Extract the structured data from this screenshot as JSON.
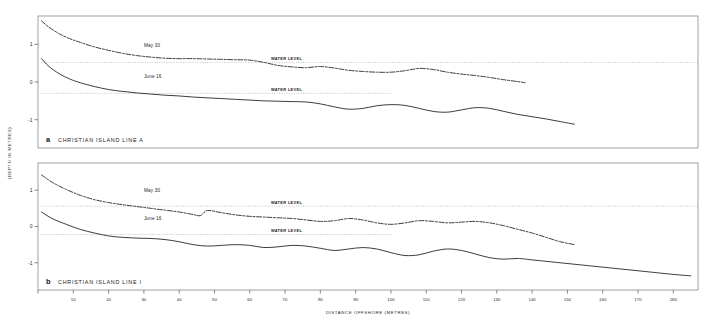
{
  "figure": {
    "xlabel": "DISTANCE OFFSHORE (METRES)",
    "ylabel": "(DEPTH IN METRES)"
  },
  "chart_data": {
    "type": "line",
    "title": "",
    "xlabel": "DISTANCE OFFSHORE (METRES)",
    "ylabel": "(DEPTH IN METRES)",
    "xlim": [
      0,
      187
    ],
    "ylim": [
      -1.75,
      1.75
    ],
    "xticks": [
      0,
      10,
      20,
      30,
      40,
      50,
      60,
      70,
      80,
      90,
      100,
      110,
      120,
      130,
      140,
      150,
      160,
      170,
      180
    ],
    "yticks": [
      1,
      0,
      -1
    ],
    "ytick_labels": [
      "1",
      "0",
      "-1"
    ],
    "grid": false,
    "legend": "inline-annotations",
    "panels": [
      {
        "tag": "a",
        "caption": "CHRISTIAN ISLAND   LINE A",
        "series": [
          {
            "name": "May 30",
            "style": "dashed",
            "label": "May 30",
            "label_x": 30,
            "label_y": 0.92,
            "x": [
              1,
              3,
              6,
              9,
              12,
              16,
              20,
              24,
              28,
              32,
              36,
              40,
              44,
              48,
              52,
              56,
              60,
              64,
              68,
              72,
              76,
              80,
              84,
              88,
              92,
              96,
              100,
              104,
              108,
              112,
              116,
              120,
              124,
              128,
              132,
              136,
              138
            ],
            "y": [
              1.62,
              1.46,
              1.28,
              1.15,
              1.05,
              0.93,
              0.84,
              0.76,
              0.7,
              0.66,
              0.63,
              0.62,
              0.62,
              0.61,
              0.6,
              0.59,
              0.58,
              0.52,
              0.44,
              0.4,
              0.38,
              0.41,
              0.37,
              0.31,
              0.28,
              0.26,
              0.26,
              0.3,
              0.36,
              0.33,
              0.26,
              0.21,
              0.17,
              0.12,
              0.06,
              0.01,
              -0.02
            ]
          },
          {
            "name": "June 16",
            "style": "solid",
            "label": "June 16",
            "label_x": 30,
            "label_y": 0.1,
            "x": [
              1,
              3,
              6,
              9,
              12,
              16,
              20,
              24,
              28,
              32,
              36,
              40,
              44,
              48,
              52,
              56,
              60,
              64,
              68,
              72,
              76,
              80,
              84,
              88,
              92,
              96,
              100,
              104,
              108,
              112,
              116,
              120,
              124,
              128,
              132,
              136,
              140,
              144,
              148,
              152
            ],
            "y": [
              0.62,
              0.42,
              0.22,
              0.08,
              -0.02,
              -0.12,
              -0.2,
              -0.25,
              -0.29,
              -0.32,
              -0.35,
              -0.37,
              -0.4,
              -0.42,
              -0.44,
              -0.46,
              -0.48,
              -0.5,
              -0.51,
              -0.52,
              -0.53,
              -0.58,
              -0.66,
              -0.72,
              -0.7,
              -0.63,
              -0.6,
              -0.62,
              -0.7,
              -0.78,
              -0.8,
              -0.74,
              -0.68,
              -0.7,
              -0.78,
              -0.86,
              -0.92,
              -0.98,
              -1.05,
              -1.12
            ]
          }
        ],
        "water_levels": [
          {
            "label": "WATER LEVEL",
            "y": 0.52,
            "x_start": 1,
            "x_end": 187,
            "label_x": 66
          },
          {
            "label": "WATER LEVEL",
            "y": -0.3,
            "x_start": 1,
            "x_end": 100,
            "label_x": 66
          }
        ]
      },
      {
        "tag": "b",
        "caption": "CHRISTIAN ISLAND    LINE I",
        "series": [
          {
            "name": "May 30",
            "style": "dashed",
            "label": "May 30",
            "label_x": 30,
            "label_y": 0.95,
            "x": [
              1,
              4,
              8,
              12,
              16,
              20,
              24,
              28,
              32,
              36,
              40,
              44,
              46,
              48,
              52,
              56,
              60,
              64,
              68,
              72,
              76,
              80,
              84,
              88,
              92,
              96,
              100,
              104,
              108,
              112,
              116,
              120,
              124,
              128,
              132,
              136,
              140,
              144,
              148,
              152
            ],
            "y": [
              1.42,
              1.22,
              1.02,
              0.86,
              0.74,
              0.66,
              0.6,
              0.55,
              0.5,
              0.45,
              0.4,
              0.33,
              0.3,
              0.44,
              0.38,
              0.32,
              0.28,
              0.26,
              0.24,
              0.22,
              0.18,
              0.14,
              0.16,
              0.22,
              0.18,
              0.1,
              0.06,
              0.1,
              0.16,
              0.14,
              0.1,
              0.12,
              0.14,
              0.1,
              0.02,
              -0.08,
              -0.18,
              -0.3,
              -0.42,
              -0.5
            ]
          },
          {
            "name": "June 16",
            "style": "solid",
            "label": "June 16",
            "label_x": 30,
            "label_y": 0.18,
            "x": [
              1,
              4,
              8,
              12,
              16,
              20,
              24,
              28,
              32,
              36,
              40,
              44,
              48,
              52,
              56,
              60,
              64,
              68,
              72,
              76,
              80,
              84,
              88,
              92,
              96,
              100,
              104,
              108,
              112,
              116,
              120,
              124,
              128,
              132,
              136,
              140,
              148,
              156,
              164,
              172,
              180,
              185
            ],
            "y": [
              0.4,
              0.22,
              0.06,
              -0.08,
              -0.18,
              -0.26,
              -0.3,
              -0.32,
              -0.33,
              -0.36,
              -0.42,
              -0.5,
              -0.54,
              -0.52,
              -0.5,
              -0.52,
              -0.58,
              -0.56,
              -0.52,
              -0.54,
              -0.6,
              -0.66,
              -0.62,
              -0.58,
              -0.62,
              -0.72,
              -0.8,
              -0.78,
              -0.68,
              -0.62,
              -0.66,
              -0.76,
              -0.86,
              -0.9,
              -0.88,
              -0.92,
              -1.0,
              -1.08,
              -1.16,
              -1.24,
              -1.32,
              -1.36
            ]
          }
        ],
        "water_levels": [
          {
            "label": "WATER LEVEL",
            "y": 0.56,
            "x_start": 1,
            "x_end": 187,
            "label_x": 66
          },
          {
            "label": "WATER LEVEL",
            "y": -0.22,
            "x_start": 1,
            "x_end": 100,
            "label_x": 66
          }
        ]
      }
    ]
  }
}
